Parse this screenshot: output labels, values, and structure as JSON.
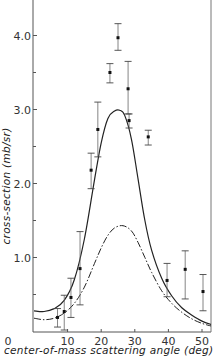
{
  "chart_data": {
    "type": "scatter",
    "title": "",
    "xlabel": "center-of-mass scattering angle (deg)",
    "ylabel": "cross-section (mb/sr)",
    "xlim": [
      0,
      53
    ],
    "ylim": [
      0,
      4.45
    ],
    "x_ticks": [
      0,
      10,
      20,
      30,
      40,
      50
    ],
    "x_tick_labels": [
      "0",
      "10",
      "20",
      "30",
      "40",
      "50"
    ],
    "y_ticks": [
      1.0,
      2.0,
      3.0,
      4.0
    ],
    "y_tick_labels": [
      "1.0",
      "2.0",
      "3.0",
      "4.0"
    ],
    "y_minor_ticks": [
      0.5,
      1.5,
      2.5,
      3.5
    ],
    "grid": false,
    "legend": null,
    "series": [
      {
        "name": "measured",
        "kind": "points-with-error-bars",
        "points": [
          {
            "x": 7.0,
            "y": 0.19,
            "err_lo": 0.06,
            "err_hi": 0.31
          },
          {
            "x": 9.0,
            "y": 0.27,
            "err_lo": 0.02,
            "err_hi": 0.49
          },
          {
            "x": 11.0,
            "y": 0.46,
            "err_lo": 0.19,
            "err_hi": 0.72
          },
          {
            "x": 13.7,
            "y": 0.85,
            "err_lo": 0.36,
            "err_hi": 1.35
          },
          {
            "x": 17.0,
            "y": 2.18,
            "err_lo": 1.93,
            "err_hi": 2.41
          },
          {
            "x": 19.0,
            "y": 2.73,
            "err_lo": 2.36,
            "err_hi": 3.1
          },
          {
            "x": 22.6,
            "y": 3.5,
            "err_lo": 3.36,
            "err_hi": 3.62
          },
          {
            "x": 25.0,
            "y": 3.97,
            "err_lo": 3.8,
            "err_hi": 4.16
          },
          {
            "x": 28.0,
            "y": 3.28,
            "err_lo": 2.94,
            "err_hi": 3.65
          },
          {
            "x": 28.3,
            "y": 2.85,
            "err_lo": 2.75,
            "err_hi": 2.94
          },
          {
            "x": 34.0,
            "y": 2.63,
            "err_lo": 2.52,
            "err_hi": 2.72
          },
          {
            "x": 39.6,
            "y": 0.69,
            "err_lo": 0.47,
            "err_hi": 0.92
          },
          {
            "x": 45.0,
            "y": 0.84,
            "err_lo": 0.44,
            "err_hi": 1.09
          },
          {
            "x": 50.3,
            "y": 0.54,
            "err_lo": 0.28,
            "err_hi": 0.77
          }
        ]
      },
      {
        "name": "theory-solid",
        "kind": "solid-line",
        "x": [
          0,
          3,
          6,
          9,
          12,
          15,
          18,
          20,
          22,
          24,
          25.5,
          27,
          29,
          31,
          33,
          35,
          38,
          41,
          44,
          47,
          50,
          53
        ],
        "y": [
          0.28,
          0.27,
          0.31,
          0.42,
          0.7,
          1.25,
          2.05,
          2.55,
          2.88,
          2.98,
          2.99,
          2.92,
          2.6,
          2.05,
          1.5,
          1.1,
          0.72,
          0.48,
          0.32,
          0.22,
          0.14,
          0.09
        ]
      },
      {
        "name": "theory-dash-dot",
        "kind": "dash-dot-line",
        "x": [
          0,
          3,
          6,
          9,
          12,
          15,
          18,
          20,
          22,
          24,
          26.5,
          29,
          31,
          33,
          35,
          38,
          41,
          44,
          47,
          50,
          53
        ],
        "y": [
          0.18,
          0.16,
          0.18,
          0.25,
          0.38,
          0.6,
          0.92,
          1.13,
          1.3,
          1.4,
          1.43,
          1.36,
          1.2,
          1.0,
          0.8,
          0.55,
          0.38,
          0.26,
          0.17,
          0.11,
          0.07
        ]
      }
    ]
  }
}
